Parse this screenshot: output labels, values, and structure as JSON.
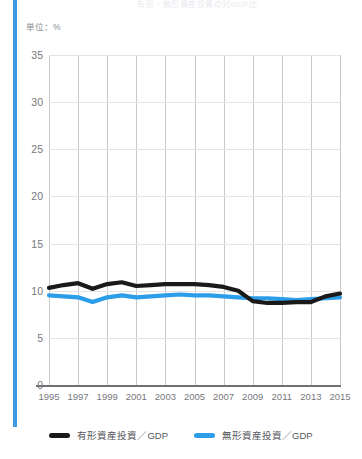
{
  "accent_color": "#3d9ae2",
  "title": "有形・無形資産投資の対GDP比",
  "unit_label": "単位：%",
  "legend": {
    "items": [
      {
        "label": "有形資産投資／GDP",
        "color": "#1a1a1a"
      },
      {
        "label": "無形資産投資／GDP",
        "color": "#2c9de8"
      }
    ]
  },
  "chart_data": {
    "type": "line",
    "title": "有形・無形資産投資の対GDP比",
    "xlabel": "",
    "ylabel": "",
    "unit": "%",
    "grid": true,
    "legend_position": "bottom",
    "xlim": [
      1995,
      2015
    ],
    "ylim": [
      0,
      35
    ],
    "ytick_labels": [
      "0",
      "5",
      "10",
      "15",
      "20",
      "25",
      "30",
      "35"
    ],
    "yticks": [
      0,
      5,
      10,
      15,
      20,
      25,
      30,
      35
    ],
    "xtick_labels": [
      "1995",
      "1997",
      "1999",
      "2001",
      "2003",
      "2005",
      "2007",
      "2009",
      "2011",
      "2013",
      "2015"
    ],
    "xticks": [
      1995,
      1997,
      1999,
      2001,
      2003,
      2005,
      2007,
      2009,
      2011,
      2013,
      2015
    ],
    "x": [
      1995,
      1996,
      1997,
      1998,
      1999,
      2000,
      2001,
      2002,
      2003,
      2004,
      2005,
      2006,
      2007,
      2008,
      2009,
      2010,
      2011,
      2012,
      2013,
      2014,
      2015
    ],
    "series": [
      {
        "name": "有形資産投資／GDP",
        "color": "#1a1a1a",
        "values": [
          10.3,
          10.6,
          10.8,
          10.2,
          10.7,
          10.9,
          10.5,
          10.6,
          10.7,
          10.7,
          10.7,
          10.6,
          10.4,
          10.0,
          8.9,
          8.7,
          8.7,
          8.8,
          8.8,
          9.4,
          9.7
        ]
      },
      {
        "name": "無形資産投資／GDP",
        "color": "#2c9de8",
        "values": [
          9.5,
          9.4,
          9.3,
          8.8,
          9.3,
          9.5,
          9.3,
          9.4,
          9.5,
          9.6,
          9.5,
          9.5,
          9.4,
          9.3,
          9.2,
          9.2,
          9.1,
          9.0,
          9.1,
          9.2,
          9.3
        ]
      }
    ]
  }
}
